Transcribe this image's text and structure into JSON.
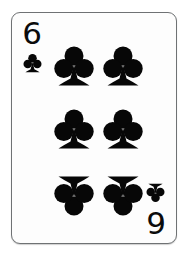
{
  "card": {
    "name": "Six of Clubs",
    "rank": "6",
    "suit": "clubs",
    "suit_symbol": "♣",
    "pip_count": 6,
    "face_color": "#fdfdfd",
    "ink_color": "#070707",
    "border_color": "#6f7274",
    "background_color": "#ffffff",
    "orientation": "upright"
  },
  "indices": [
    {
      "position": "top-left",
      "rank": "6",
      "suit_icon": "club-icon",
      "rotated": false
    },
    {
      "position": "bottom-right",
      "rank": "6",
      "suit_icon": "club-icon",
      "rotated": true
    }
  ],
  "pips": [
    {
      "row": "top",
      "column": "left",
      "flipped": false
    },
    {
      "row": "top",
      "column": "right",
      "flipped": false
    },
    {
      "row": "middle",
      "column": "left",
      "flipped": false
    },
    {
      "row": "middle",
      "column": "right",
      "flipped": false
    },
    {
      "row": "bottom",
      "column": "left",
      "flipped": true
    },
    {
      "row": "bottom",
      "column": "right",
      "flipped": true
    }
  ]
}
